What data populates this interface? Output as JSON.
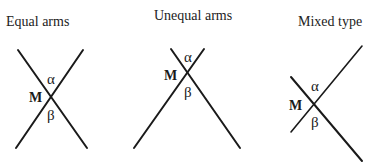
{
  "panels": [
    {
      "title": "Equal arms",
      "point_label": "M",
      "upper_angle_label": "α",
      "lower_angle_label": "β",
      "lines": [
        {
          "x1": 18,
          "y1": 50,
          "x2": 87,
          "y2": 148
        },
        {
          "x1": 83,
          "y1": 50,
          "x2": 16,
          "y2": 148
        }
      ]
    },
    {
      "title": "Unequal arms",
      "point_label": "M",
      "upper_angle_label": "α",
      "lower_angle_label": "β",
      "lines": [
        {
          "x1": 171,
          "y1": 49,
          "x2": 240,
          "y2": 148
        },
        {
          "x1": 204,
          "y1": 49,
          "x2": 134,
          "y2": 148
        }
      ]
    },
    {
      "title": "Mixed type",
      "point_label": "M",
      "upper_angle_label": "α",
      "lower_angle_label": "β",
      "lines": [
        {
          "x1": 291,
          "y1": 77,
          "x2": 362,
          "y2": 161
        },
        {
          "x1": 362,
          "y1": 46,
          "x2": 291,
          "y2": 132
        }
      ]
    }
  ]
}
